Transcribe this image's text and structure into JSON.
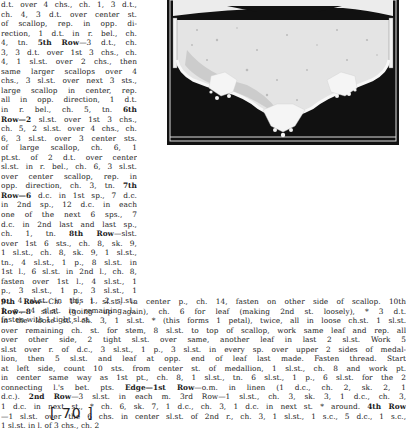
{
  "page": {
    "page_number": "[ 70 ]"
  },
  "left_column": {
    "lines": [
      "d.t. over 4 chs., ch. 1, 3 d.t.,",
      "ch. 4, 3 d.t. over center st.",
      "of scallop, rep. in opp. di-",
      "rection, 1 d.t. in r. bel., ch.",
      "4, tn.  5th Row—3 d.t., ch.",
      "3, 3 d.t. over 1st 3 chs., ch.",
      "4, 1 sl.st. over 2 chs., then",
      "same larger scallops over 4",
      "chs., 3 sl.st. over next 3 sts.,",
      "large scallop in center, rep.",
      "all in opp. direction, 1 d.t.",
      "in r. bel., ch. 5, tn.  6th",
      "Row—2 sl.st. over 1st 3 chs.,",
      "ch. 5, 2 sl.st. over 4 chs., ch.",
      "6, 3 sl.st. over 3 center sts.",
      "of large scallop, ch. 6, 1",
      "pt.st. of 2 d.t. over center",
      "sl.st. in r. bel., ch. 6, 3 sl.st.",
      "over center scallop, rep. in",
      "opp. direction, ch. 3, tn. 7th",
      "Row—6 d.c. in 1st sp., 7 d.c.",
      "in 2nd sp., 12 d.c. in each",
      "one of the next 6 sps., 7",
      "d.c. in 2nd last and last sp.,",
      "ch. 1, tn.  8th Row—slst.",
      "over 1st 6 sts., ch. 8, sk. 9,",
      "1 sl.st., ch. 8, sk. 9, 1 sl.st.,",
      "tn., 4 sl.st., 1 p., 8 sl.st. in",
      "1st l., 6 sl.st. in 2nd l., ch. 8,",
      "fasten over 1st l., 4 sl.st., 1",
      "p., 3 sl.st., 1 p., 3 sl.st., 1",
      "p., 4 sl.st. in this l., 2 sl.st.,",
      "1 p., 4 sl.st. in remaining l.,",
      "fasten with 1 tight sl.st."
    ],
    "bold_markers": [
      "5th Row",
      "6th Row",
      "7th Row",
      "8th Row"
    ]
  },
  "full_width": {
    "lines": [
      "9th Row—Ch. 14, 1 sl.st., in center p., ch. 14, fasten on other side of scallop.  10th",
      "Row—8 sl.st. (going up again), ch. 6 for leaf (making 2nd st. loosely), * 3 d.t.",
      "in the loose st., ch. 3, 1 sl.st. * (this forms 1 petal), twice, all in loose ch.st. 1 sl.st.",
      "over remaining ch. st. for stem, 8 sl.st. to top of scallop, work same leaf and rep. all",
      "over other side, 2 tight sl.st. over same, another leaf in last 2 sl.st.  Work 5",
      "sl.st over r. of d.c., 3 sl.st., 1 p., 3 sl.st. in every sp. over upper 2 sides of medal-",
      "lion, then 5 sl.st. and leaf at opp. end of leaf last made.  Fasten thread.  Start",
      "at left side, count 10 sts. from center st. of medallion, 1 sl.st., ch. 8 and work pt.",
      "in center same way as 1st pt., ch. 8, 1 sl.st., tn. 6 sl.st., 1 p., 6 sl.st. for the 2",
      "connecting l.'s bet. pts.  Edge—1st Row—o.m. in linen (1 d.c., ch. 2, sk. 2, 1",
      "d.c.).  2nd Row—3 sl.st. in each m.  3rd Row—1 sl.st., ch. 3, sk. 3, 1 d.c., ch. 3,",
      "1 d.c. in next st., * ch. 6, sk. 7, 1 d.c., ch. 3, 1 d.c. in next st. * around.  4th Row",
      "—1 sl.st. over the 6 chs. in center sl.st. of 2nd r., ch. 3, 1 sl.st., 1 s.c., 5 d.c., 1 s.c.,",
      "1 sl.st. in l. of 3 chs., ch. 2"
    ],
    "bold_markers": [
      "9th Row",
      "10th Row",
      "Edge—1st Row",
      "2nd Row",
      "3rd Row",
      "4th Row"
    ]
  },
  "figure": {
    "colors": {
      "background": "#111111",
      "linen": "#e6e6e6",
      "lace": "#f4f4f4",
      "frame_line": "#dddddd"
    }
  }
}
